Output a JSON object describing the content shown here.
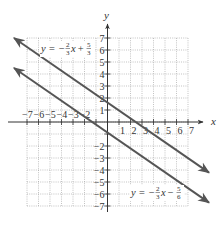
{
  "graph": {
    "x_axis_label": "x",
    "y_axis_label": "y",
    "x_ticks": [
      "−7",
      "−6",
      "−5",
      "−4",
      "−3",
      "−2",
      "1",
      "2",
      "3",
      "4",
      "5",
      "6",
      "7"
    ],
    "y_ticks": [
      "7",
      "6",
      "5",
      "4",
      "3",
      "2",
      "1",
      "−2",
      "−3",
      "−4",
      "−5",
      "−6",
      "−7"
    ],
    "line_color": "#555555",
    "grid_color": "#9a9a9a",
    "lines": [
      {
        "name": "upper-line",
        "equation_prefix": "y = −",
        "slope_num": "2",
        "slope_den": "3",
        "var": "x",
        "op": " + ",
        "const_num": "5",
        "const_den": "3"
      },
      {
        "name": "lower-line",
        "equation_prefix": "y = −",
        "slope_num": "2",
        "slope_den": "3",
        "var": "x",
        "op": " − ",
        "const_num": "5",
        "const_den": "6"
      }
    ]
  },
  "chart_data": {
    "type": "line",
    "title": "",
    "xlabel": "x",
    "ylabel": "y",
    "xlim": [
      -7,
      7
    ],
    "ylim": [
      -7,
      7
    ],
    "grid": true,
    "series": [
      {
        "name": "y = -2/3 x + 5/3",
        "slope": -0.6667,
        "intercept": 1.6667,
        "x": [
          -8.13,
          8.83
        ],
        "y": [
          7.09,
          -4.22
        ]
      },
      {
        "name": "y = -2/3 x - 5/6",
        "slope": -0.6667,
        "intercept": -0.8333,
        "x": [
          -8.13,
          8.83
        ],
        "y": [
          4.59,
          -6.72
        ]
      }
    ],
    "x_tick_labels": [
      -7,
      -6,
      -5,
      -4,
      -3,
      -2,
      1,
      2,
      3,
      4,
      5,
      6,
      7
    ],
    "y_tick_labels": [
      7,
      6,
      5,
      4,
      3,
      2,
      1,
      -2,
      -3,
      -4,
      -5,
      -6,
      -7
    ]
  }
}
